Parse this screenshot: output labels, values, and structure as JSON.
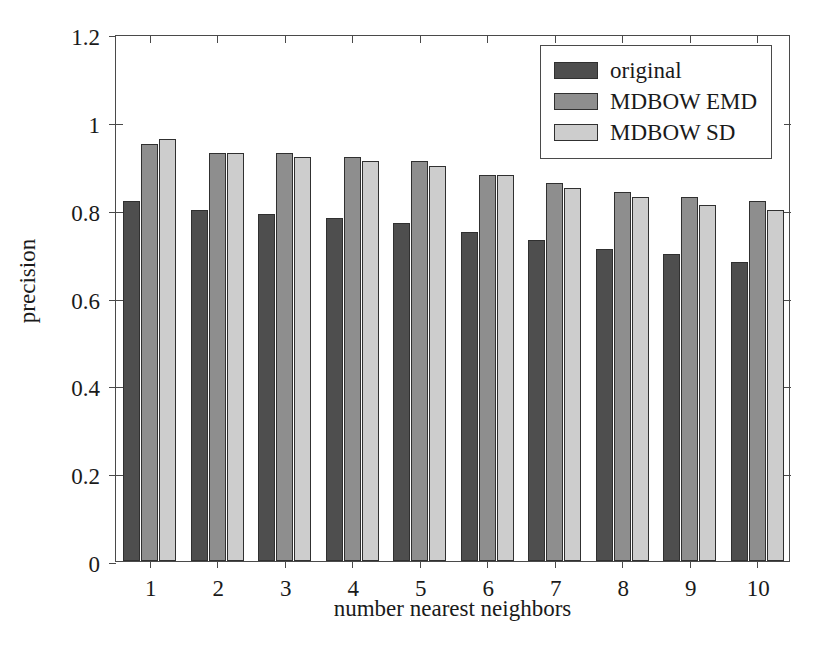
{
  "chart_data": {
    "type": "bar",
    "title": "",
    "xlabel": "number nearest neighbors",
    "ylabel": "precision",
    "categories": [
      "1",
      "2",
      "3",
      "4",
      "5",
      "6",
      "7",
      "8",
      "9",
      "10"
    ],
    "series": [
      {
        "name": "original",
        "color": "#4e4e4e",
        "values": [
          0.82,
          0.8,
          0.79,
          0.78,
          0.77,
          0.75,
          0.73,
          0.71,
          0.7,
          0.68
        ]
      },
      {
        "name": "MDBOW EMD",
        "color": "#8e8e8e",
        "values": [
          0.95,
          0.93,
          0.93,
          0.92,
          0.91,
          0.88,
          0.86,
          0.84,
          0.83,
          0.82
        ]
      },
      {
        "name": "MDBOW SD",
        "color": "#cdcdcd",
        "values": [
          0.96,
          0.93,
          0.92,
          0.91,
          0.9,
          0.88,
          0.85,
          0.83,
          0.81,
          0.8
        ]
      }
    ],
    "ylim": [
      0,
      1.2
    ],
    "yticks": [
      "0",
      "0.2",
      "0.4",
      "0.6",
      "0.8",
      "1",
      "1.2"
    ],
    "ytick_values": [
      0,
      0.2,
      0.4,
      0.6,
      0.8,
      1,
      1.2
    ],
    "grid": false,
    "legend_position": "top-right"
  }
}
